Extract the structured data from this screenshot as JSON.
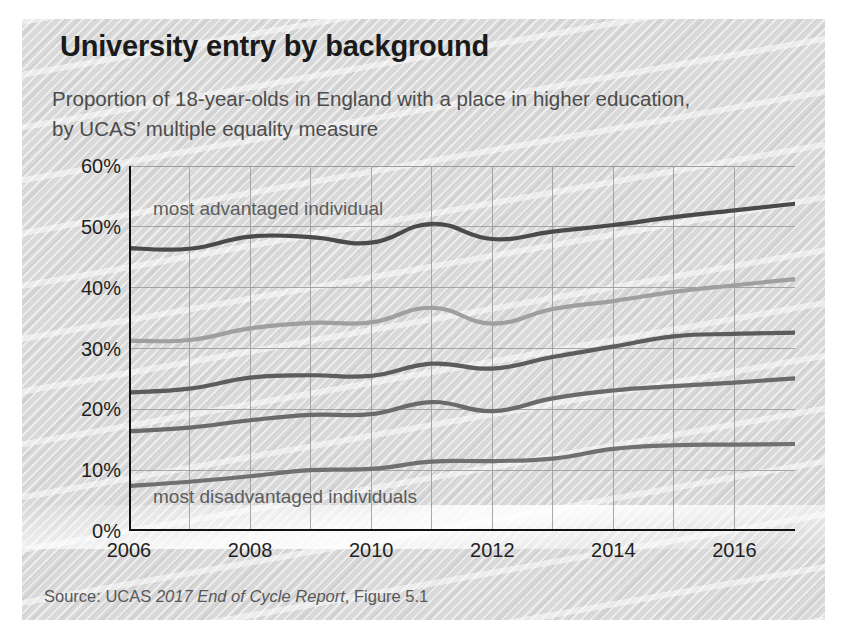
{
  "figure": {
    "title": "University entry by background",
    "subtitle": "Proportion of 18-year-olds in England with a place in higher education, by UCAS’ multiple equality measure",
    "source_prefix": "Source: UCAS ",
    "source_italic": "2017 End of Cycle Report",
    "source_suffix": ", Figure 5.1"
  },
  "annotations": {
    "top_note": "most advantaged individual",
    "bottom_note": "most disadvantaged individuals"
  },
  "axes": {
    "y_ticks": [
      "60%",
      "50%",
      "40%",
      "30%",
      "20%",
      "10%",
      "0%"
    ],
    "x_ticks": [
      "2006",
      "2008",
      "2010",
      "2012",
      "2014",
      "2016"
    ]
  },
  "colors": {
    "panel_background": "#d9d9d9",
    "title_text": "#1a1a1a",
    "subtitle_text": "#4c4c4c",
    "source_text": "#58585a",
    "axis_line": "#111111",
    "gridline": "#9b9b9b",
    "group5_advantaged": "#4a4a4a",
    "group4": "#9f9f9f",
    "group3": "#5c5c5c",
    "group2": "#6a6a6a",
    "group1_disadvantaged": "#707070"
  },
  "chart_data": {
    "type": "line",
    "title": "University entry by background",
    "subtitle": "Proportion of 18-year-olds in England with a place in higher education, by UCAS’ multiple equality measure",
    "xlabel": "",
    "ylabel": "",
    "xlim": [
      2006,
      2017
    ],
    "ylim": [
      0,
      60
    ],
    "y_unit": "%",
    "grid": true,
    "legend": "inline-annotations",
    "x": [
      2006,
      2007,
      2008,
      2009,
      2010,
      2011,
      2012,
      2013,
      2014,
      2015,
      2016,
      2017
    ],
    "series": [
      {
        "name": "most advantaged individual",
        "color": "#4a4a4a",
        "values": [
          46.5,
          46.4,
          48.4,
          48.3,
          47.4,
          50.5,
          48.0,
          49.2,
          50.3,
          51.6,
          52.7,
          53.8
        ]
      },
      {
        "name": "group 4",
        "color": "#9f9f9f",
        "values": [
          31.3,
          31.4,
          33.3,
          34.2,
          34.3,
          36.7,
          34.1,
          36.5,
          37.8,
          39.3,
          40.4,
          41.4
        ]
      },
      {
        "name": "group 3",
        "color": "#5c5c5c",
        "values": [
          22.8,
          23.4,
          25.2,
          25.6,
          25.5,
          27.5,
          26.7,
          28.6,
          30.3,
          32.0,
          32.4,
          32.6
        ]
      },
      {
        "name": "group 2",
        "color": "#6a6a6a",
        "values": [
          16.4,
          17.0,
          18.2,
          19.1,
          19.2,
          21.2,
          19.7,
          21.8,
          23.1,
          23.8,
          24.4,
          25.1
        ]
      },
      {
        "name": "most disadvantaged individuals",
        "color": "#707070",
        "values": [
          7.4,
          8.1,
          9.0,
          10.0,
          10.2,
          11.4,
          11.5,
          11.9,
          13.5,
          14.1,
          14.2,
          14.3
        ]
      }
    ]
  }
}
